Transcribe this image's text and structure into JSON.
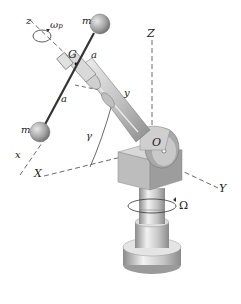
{
  "diagram": {
    "labels": {
      "z_small": "z",
      "omega_p": "ω",
      "omega_p_sub": "p",
      "m_top": "m",
      "m_bottom": "m",
      "a_top": "a",
      "a_bottom": "a",
      "G": "G",
      "y_small": "y",
      "Z_big": "Z",
      "x_small": "x",
      "gamma": "γ",
      "O": "O",
      "X_big": "X",
      "Y_big": "Y",
      "Omega": "Ω"
    },
    "colors": {
      "metal_light": "#e6e6e6",
      "metal_mid": "#b9b9b9",
      "metal_dark": "#7a7a7a",
      "line": "#333333",
      "ball": "#a8a8a8"
    }
  }
}
